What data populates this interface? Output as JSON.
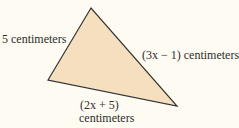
{
  "diagram": {
    "shape": "triangle",
    "colors": {
      "background": "#fdfbf2",
      "fill": "#f5dfbf",
      "stroke": "#333333",
      "text": "#2e2e2e"
    },
    "vertices": {
      "top": [
        91,
        8
      ],
      "left": [
        48,
        80
      ],
      "bottom_right": [
        177,
        106
      ]
    },
    "sides": [
      {
        "id": "left-side",
        "label": "5 centimeters"
      },
      {
        "id": "right-side",
        "label": "(3x − 1) centimeters"
      },
      {
        "id": "bottom-side",
        "label_expr": "(2x + 5)",
        "label_unit": "centimeters"
      }
    ]
  }
}
